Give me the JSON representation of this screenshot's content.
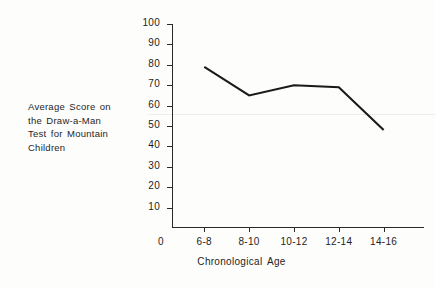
{
  "chart_data": {
    "type": "line",
    "title": "",
    "subtitle": "",
    "xlabel": "Chronological Age",
    "ylabel": "Average Score on the Draw-a-Man Test for Mountain Children",
    "ylabel_lines": [
      "Average Score on",
      "the Draw-a-Man",
      "Test for Mountain",
      "Children"
    ],
    "categories": [
      "6-8",
      "8-10",
      "10-12",
      "12-14",
      "14-16"
    ],
    "values": [
      79,
      65,
      70,
      69,
      48
    ],
    "series": [
      {
        "name": "Average Score",
        "values": [
          79,
          65,
          70,
          69,
          48
        ]
      }
    ],
    "ylim": [
      0,
      100
    ],
    "y_ticks": [
      10,
      20,
      30,
      40,
      50,
      60,
      70,
      80,
      90,
      100
    ],
    "y_tick_labels": [
      "10",
      "20",
      "30",
      "40",
      "50",
      "60",
      "70",
      "80",
      "90",
      "100"
    ],
    "origin_label": "0",
    "grid": false,
    "legend": false,
    "line_color": "#1a1a1a",
    "background_color": "#fdfdfc",
    "axis_color": "#2a2a2a"
  }
}
